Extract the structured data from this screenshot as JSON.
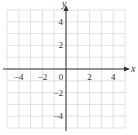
{
  "chart_data": {
    "type": "scatter",
    "title": "",
    "xlabel": "x",
    "ylabel": "y",
    "xlim": [
      -5,
      5
    ],
    "ylim": [
      -5,
      5
    ],
    "grid": true,
    "grid_step": 1,
    "x_ticks": [
      -4,
      -2,
      0,
      2,
      4
    ],
    "y_ticks": [
      -4,
      -2,
      2,
      4
    ],
    "x_tick_labels": [
      "−4",
      "−2",
      "0",
      "2",
      "4"
    ],
    "y_tick_labels": [
      "−4",
      "−2",
      "2",
      "4"
    ],
    "series": [],
    "legend": null
  },
  "colors": {
    "grid": "#d9d9d9",
    "axis": "#333333",
    "text": "#333333"
  }
}
